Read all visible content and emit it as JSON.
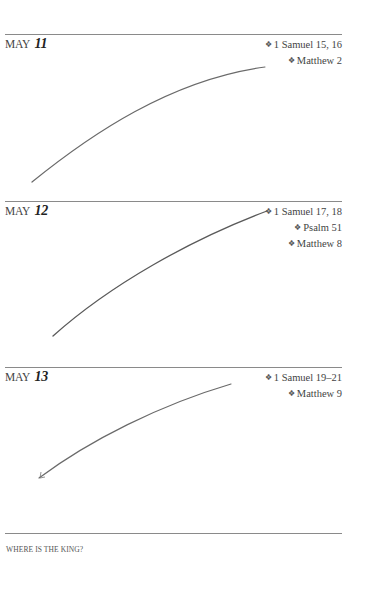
{
  "entries": [
    {
      "month": "MAY",
      "day": "11",
      "readings": [
        "1 Samuel 15, 16",
        "Matthew 2"
      ]
    },
    {
      "month": "MAY",
      "day": "12",
      "readings": [
        "1 Samuel 17, 18",
        "Psalm 51",
        "Matthew 8"
      ]
    },
    {
      "month": "MAY",
      "day": "13",
      "readings": [
        "1 Samuel 19–21",
        "Matthew 9"
      ]
    }
  ],
  "footer": {
    "running_title": "WHERE IS THE KING?"
  },
  "icons": {
    "bullet": "❖"
  },
  "colors": {
    "rule": "#8a8a8a",
    "ink": "#555555"
  }
}
